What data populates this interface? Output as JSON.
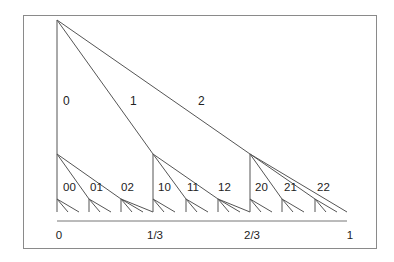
{
  "diagram": {
    "level1_labels": [
      "0",
      "1",
      "2"
    ],
    "level2_labels": [
      "00",
      "01",
      "02",
      "10",
      "11",
      "12",
      "20",
      "21",
      "22"
    ],
    "axis_labels": [
      "0",
      "1/3",
      "2/3",
      "1"
    ],
    "colors": {
      "line": "#555555",
      "frame": "#8a8a8a",
      "text": "#222222"
    }
  }
}
